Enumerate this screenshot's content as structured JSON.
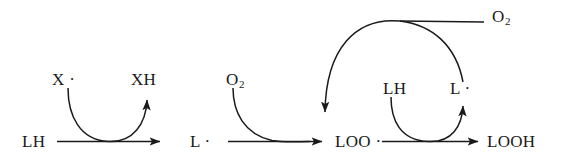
{
  "diagram": {
    "type": "reaction-scheme",
    "background_color": "#ffffff",
    "stroke_color": "#1a1a1a",
    "main_chain": [
      {
        "id": "lh-start",
        "label": "LH",
        "x": 22,
        "y": 133
      },
      {
        "id": "l-radical",
        "label": "L ·",
        "x": 190,
        "y": 133
      },
      {
        "id": "loo",
        "label": "LOO ·",
        "x": 335,
        "y": 133
      },
      {
        "id": "looh",
        "label": "LOOH",
        "x": 487,
        "y": 133
      }
    ],
    "side_species": [
      {
        "id": "x-radical",
        "label": "X ·",
        "x": 52,
        "y": 71,
        "role": "reactant-in"
      },
      {
        "id": "xh",
        "label": "XH",
        "x": 131,
        "y": 71,
        "role": "product-out"
      },
      {
        "id": "o2-left",
        "label": "O",
        "sub": "2",
        "x": 226,
        "y": 71,
        "role": "reactant-in"
      },
      {
        "id": "lh-cycle",
        "label": "LH",
        "x": 383,
        "y": 80,
        "role": "reactant-in"
      },
      {
        "id": "l-cycle",
        "label": "L ·",
        "x": 450,
        "y": 80,
        "role": "product-out"
      },
      {
        "id": "o2-top",
        "label": "O",
        "sub": "2",
        "x": 492,
        "y": 8,
        "role": "reactant-in"
      }
    ],
    "arrows": [
      {
        "id": "arrow-lh-to-l",
        "from": "LH",
        "to": "L ·",
        "kind": "straight-right"
      },
      {
        "id": "arrow-l-to-loo",
        "from": "L ·",
        "to": "LOO ·",
        "kind": "straight-right"
      },
      {
        "id": "arrow-loo-to-looh",
        "from": "LOO ·",
        "to": "LOOH",
        "kind": "straight-right"
      },
      {
        "id": "curve-x-to-xh",
        "from": "X ·",
        "to": "XH",
        "kind": "curved-u"
      },
      {
        "id": "curve-o2-in",
        "from": "O2",
        "to": "LOO ·",
        "kind": "curved-in"
      },
      {
        "id": "curve-lh-to-l",
        "from": "LH",
        "to": "L ·",
        "kind": "curved-u"
      },
      {
        "id": "curve-o2-top-loop",
        "from": "O2",
        "to": "LOO ·",
        "kind": "big-arc-down"
      }
    ]
  }
}
